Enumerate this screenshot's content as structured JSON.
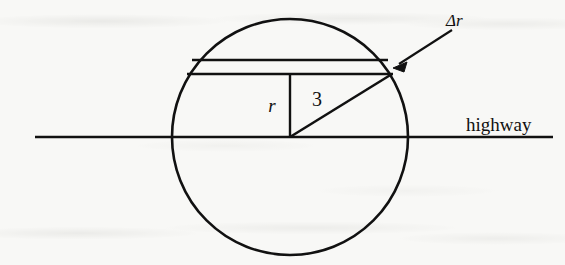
{
  "figure": {
    "caption_alt": "Circular region crossed by a straight highway, with an annular strip of width delta-r",
    "background_color": "#f8f8f6",
    "ink_color": "#111111",
    "labels": {
      "radius_label": "r",
      "chord_distance_label": "3",
      "strip_width_label": "Δr",
      "baseline_label": "highway"
    },
    "geometry": {
      "circle": {
        "center_x": 290,
        "center_y": 137,
        "radius": 118
      },
      "highway_line": {
        "x_start": 35,
        "x_end": 553,
        "y": 137
      },
      "strip_upper_chord": {
        "x_start": 192,
        "x_end": 388,
        "y": 60
      },
      "strip_lower_chord": {
        "x_start": 187,
        "x_end": 393,
        "y": 74
      },
      "radius_segment": {
        "x": 290,
        "y_start": 74,
        "y_end": 137
      },
      "hypotenuse_segment": {
        "x_start": 290,
        "y_start": 137,
        "x_end": 392,
        "y_end": 74
      },
      "annotation_arrow": {
        "tail_x": 452,
        "tail_y": 30,
        "tip_x": 393,
        "tip_y": 68
      }
    },
    "label_positions": {
      "radius_label": {
        "x": 272,
        "y": 112
      },
      "chord_distance_label": {
        "x": 317,
        "y": 106
      },
      "strip_width_label": {
        "x": 446,
        "y": 26
      },
      "baseline_label": {
        "x": 466,
        "y": 131
      }
    }
  }
}
